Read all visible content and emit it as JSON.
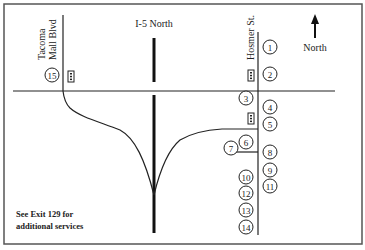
{
  "map": {
    "roads": {
      "highway": "I-5 North",
      "west_street": "Tacoma Mall Blvd",
      "west_street_line1": "Tacoma",
      "west_street_line2": "Mall Blvd",
      "east_street": "Hosmer St."
    },
    "compass": {
      "label": "North",
      "icon": "north-arrow-icon"
    },
    "note": {
      "line1": "See Exit 129 for",
      "line2": "additional services"
    },
    "markers": [
      "1",
      "2",
      "3",
      "4",
      "5",
      "6",
      "7",
      "8",
      "9",
      "10",
      "11",
      "12",
      "13",
      "14",
      "15"
    ],
    "traffic_signals": [
      "tacoma-mall-blvd",
      "hosmer-st-north",
      "hosmer-st-south"
    ]
  }
}
